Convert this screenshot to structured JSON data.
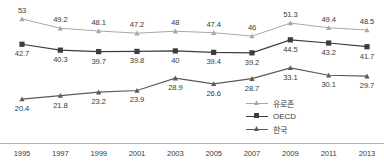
{
  "chart_data": {
    "type": "line",
    "title": "",
    "xlabel": "",
    "ylabel": "",
    "categories": [
      "1995",
      "1997",
      "1999",
      "2001",
      "2003",
      "2005",
      "2007",
      "2009",
      "2011",
      "2013"
    ],
    "x": [
      1995,
      1997,
      1999,
      2001,
      2003,
      2005,
      2007,
      2009,
      2011,
      2013
    ],
    "xlim": [
      1995,
      2013
    ],
    "ylim": [
      18,
      55
    ],
    "grid": false,
    "legend_position": "bottom-center",
    "series": [
      {
        "name": "유로존",
        "color": "#a8a8a8",
        "marker": "triangle",
        "label_position": "above",
        "values": [
          53,
          49.2,
          48.1,
          47.2,
          48,
          47.4,
          46,
          51.3,
          49.4,
          48.5
        ],
        "labels": [
          "53",
          "49.2",
          "48.1",
          "47.2",
          "48",
          "47.4",
          "46",
          "51.3",
          "49.4",
          "48.5"
        ]
      },
      {
        "name": "OECD",
        "color": "#3c3c3c",
        "marker": "square",
        "label_position": "below",
        "values": [
          42.7,
          40.3,
          39.7,
          39.8,
          40,
          39.4,
          39.2,
          44.5,
          43.2,
          41.7
        ],
        "labels": [
          "42.7",
          "40.3",
          "39.7",
          "39.8",
          "40",
          "39.4",
          "39.2",
          "44.5",
          "43.2",
          "41.7"
        ]
      },
      {
        "name": "한국",
        "color": "#5a5a5a",
        "marker": "triangle",
        "label_position": "below",
        "values": [
          20.4,
          21.8,
          23.2,
          23.9,
          28.9,
          26.6,
          28.7,
          33.1,
          30.1,
          29.7
        ],
        "labels": [
          "20.4",
          "21.8",
          "23.2",
          "23.9",
          "28.9",
          "26.6",
          "28.7",
          "33.1",
          "30.1",
          "29.7"
        ]
      }
    ],
    "axis_line_color": "#b4b4b4"
  }
}
